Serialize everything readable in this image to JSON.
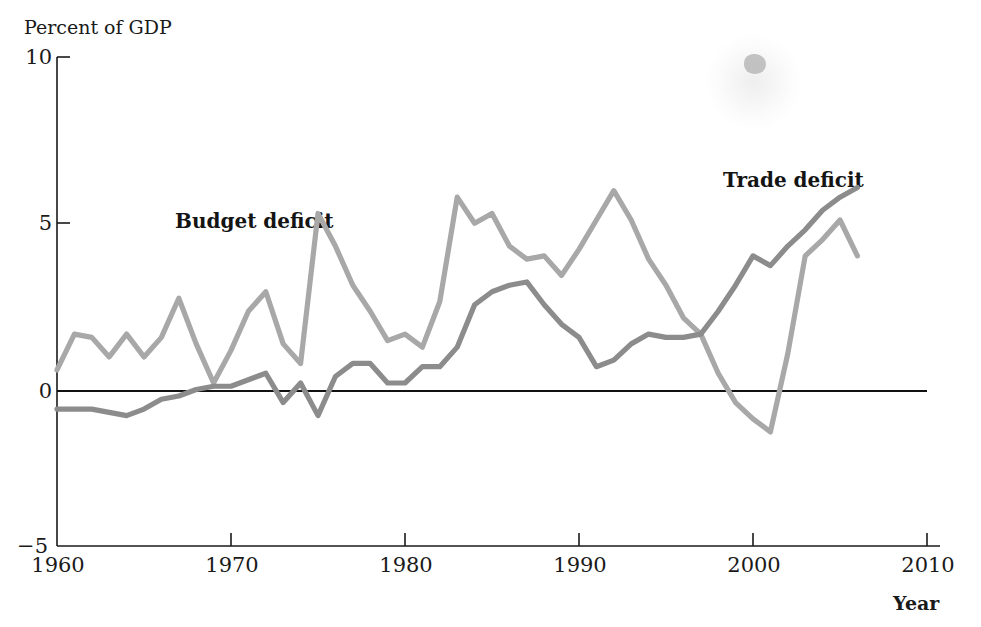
{
  "chart_data": {
    "type": "line",
    "title": "",
    "subtitle": "",
    "ylabel": "Percent of GDP",
    "xlabel": "Year",
    "xlim": [
      1960,
      2010
    ],
    "ylim": [
      -5,
      10
    ],
    "xticks": [
      1960,
      1970,
      1980,
      1990,
      2000,
      2010
    ],
    "xtick_labels": [
      "1960",
      "1970",
      "1980",
      "1990",
      "2000",
      "2010"
    ],
    "yticks": [
      -5,
      0,
      5,
      10
    ],
    "ytick_labels": [
      "−5",
      "0",
      "5",
      "10"
    ],
    "grid": false,
    "legend_position": "inline-annotations",
    "zero_line": true,
    "annotations": [
      {
        "text": "Budget deficit",
        "x": 1969,
        "y": 5.3
      },
      {
        "text": "Trade deficit",
        "x": 1999,
        "y": 6.5
      }
    ],
    "colors": {
      "budget_deficit": "#a8a8a8",
      "trade_deficit": "#8c8c8c",
      "axis": "#1a1a1a",
      "zero_line": "#111111",
      "background": "#ffffff",
      "text": "#1a1a1a"
    },
    "series": [
      {
        "name": "Budget deficit",
        "color": "#a8a8a8",
        "x": [
          1960,
          1961,
          1962,
          1963,
          1964,
          1965,
          1966,
          1967,
          1968,
          1969,
          1970,
          1971,
          1972,
          1973,
          1974,
          1975,
          1976,
          1977,
          1978,
          1979,
          1980,
          1981,
          1982,
          1983,
          1984,
          1985,
          1986,
          1987,
          1988,
          1989,
          1990,
          1991,
          1992,
          1993,
          1994,
          1995,
          1996,
          1997,
          1998,
          1999,
          2000,
          2001,
          2002,
          2003,
          2004,
          2005,
          2006
        ],
        "values": [
          0.4,
          1.5,
          1.4,
          0.8,
          1.5,
          0.8,
          1.4,
          2.6,
          1.2,
          0.0,
          1.0,
          2.2,
          2.8,
          1.2,
          0.6,
          5.2,
          4.2,
          3.0,
          2.2,
          1.3,
          1.5,
          1.1,
          2.5,
          5.7,
          4.9,
          5.2,
          4.2,
          3.8,
          3.9,
          3.3,
          4.1,
          5.0,
          5.9,
          5.0,
          3.8,
          3.0,
          2.0,
          1.5,
          0.3,
          -0.6,
          -1.1,
          -1.5,
          0.9,
          3.9,
          4.4,
          5.0,
          3.9
        ]
      },
      {
        "name": "Trade deficit",
        "color": "#8c8c8c",
        "x": [
          1960,
          1961,
          1962,
          1963,
          1964,
          1965,
          1966,
          1967,
          1968,
          1969,
          1970,
          1971,
          1972,
          1973,
          1974,
          1975,
          1976,
          1977,
          1978,
          1979,
          1980,
          1981,
          1982,
          1983,
          1984,
          1985,
          1986,
          1987,
          1988,
          1989,
          1990,
          1991,
          1992,
          1993,
          1994,
          1995,
          1996,
          1997,
          1998,
          1999,
          2000,
          2001,
          2002,
          2003,
          2004,
          2005,
          2006
        ],
        "values": [
          -0.8,
          -0.8,
          -0.8,
          -0.9,
          -1.0,
          -0.8,
          -0.5,
          -0.4,
          -0.2,
          -0.1,
          -0.1,
          0.1,
          0.3,
          -0.6,
          0.0,
          -1.0,
          0.2,
          0.6,
          0.6,
          0.0,
          0.0,
          0.5,
          0.5,
          1.1,
          2.4,
          2.8,
          3.0,
          3.1,
          2.4,
          1.8,
          1.4,
          0.5,
          0.7,
          1.2,
          1.5,
          1.4,
          1.4,
          1.5,
          2.2,
          3.0,
          3.9,
          3.6,
          4.2,
          4.7,
          5.3,
          5.7,
          6.0
        ]
      }
    ]
  },
  "axis": {
    "ylabel_title": "Percent of GDP",
    "xlabel_title": "Year",
    "ytick_0": "10",
    "ytick_1": "5",
    "ytick_2": "0",
    "ytick_3": "−5",
    "xtick_0": "1960",
    "xtick_1": "1970",
    "xtick_2": "1980",
    "xtick_3": "1990",
    "xtick_4": "2000",
    "xtick_5": "2010"
  },
  "labels": {
    "budget": "Budget deficit",
    "trade": "Trade deficit"
  }
}
